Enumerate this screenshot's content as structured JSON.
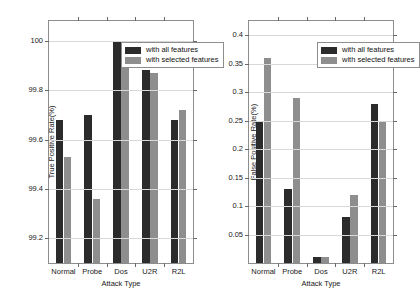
{
  "figure": {
    "panels": [
      {
        "id": "true-positive-rate",
        "chart_data": {
          "type": "bar",
          "title": "",
          "xlabel": "Attack Type",
          "ylabel": "True Positive Rate(%)",
          "categories": [
            "Normal",
            "Probe",
            "Dos",
            "U2R",
            "R2L"
          ],
          "series": [
            {
              "name": "with all features",
              "color": "#2b2b2b",
              "values": [
                99.68,
                99.7,
                100.0,
                99.88,
                99.68
              ]
            },
            {
              "name": "with selected features",
              "color": "#8e8e8e",
              "values": [
                99.53,
                99.36,
                100.0,
                99.87,
                99.72
              ]
            }
          ],
          "ylim": [
            99.1,
            100.08
          ],
          "yticks": [
            100,
            99.8,
            99.6,
            99.4,
            99.2
          ],
          "ytick_labels": [
            "100",
            "99.8",
            "99.6",
            "99.4",
            "99.2"
          ],
          "grid": true,
          "legend_position": "top-center"
        }
      },
      {
        "id": "false-positive-rate",
        "chart_data": {
          "type": "bar",
          "title": "",
          "xlabel": "Attack Type",
          "ylabel": "False Positive Rate(%)",
          "categories": [
            "Normal",
            "Probe",
            "Dos",
            "U2R",
            "R2L"
          ],
          "series": [
            {
              "name": "with all features",
              "color": "#2b2b2b",
              "values": [
                0.25,
                0.13,
                0.01,
                0.08,
                0.28
              ]
            },
            {
              "name": "with selected features",
              "color": "#8e8e8e",
              "values": [
                0.36,
                0.29,
                0.01,
                0.12,
                0.25
              ]
            }
          ],
          "ylim": [
            0.0,
            0.425
          ],
          "yticks": [
            0.4,
            0.35,
            0.3,
            0.25,
            0.2,
            0.15,
            0.1,
            0.05
          ],
          "ytick_labels": [
            "0.4",
            "0.35",
            "0.3",
            "0.25",
            "0.2",
            "0.15",
            "0.1",
            "0.05"
          ],
          "grid": true,
          "legend_position": "top-center"
        }
      }
    ]
  }
}
